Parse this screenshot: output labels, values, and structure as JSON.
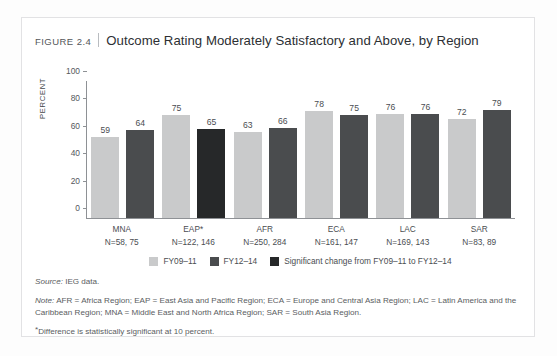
{
  "figure": {
    "number_label": "FIGURE 2.4",
    "heading": "Outcome Rating Moderately Satisfactory and Above, by Region"
  },
  "colors": {
    "series_fy0911": "#c9cacb",
    "series_fy1214": "#4a4c4e",
    "series_significant": "#262829",
    "axis": "#8e9195",
    "frame_border": "#e2e2e4",
    "text": "#4a4d51"
  },
  "notes": {
    "source_label": "Source:",
    "source_text": "IEG data.",
    "note_label": "Note:",
    "note_text": "AFR = Africa Region; EAP = East Asia and Pacific Region; ECA = Europe and Central Asia Region; LAC = Latin America and the Caribbean Region; MNA = Middle East and North Africa Region; SAR = South Asia Region.",
    "star_marker": "*",
    "star_text": "Difference is statistically significant at 10 percent."
  },
  "chart_data": {
    "type": "bar",
    "title": "Outcome Rating Moderately Satisfactory and Above, by Region",
    "xlabel": "",
    "ylabel": "PERCENT",
    "ylim": [
      0,
      100
    ],
    "yticks": [
      0,
      20,
      40,
      60,
      80,
      100
    ],
    "grid": false,
    "legend_position": "bottom-center",
    "categories": [
      "MNA",
      "EAP*",
      "AFR",
      "ECA",
      "LAC",
      "SAR"
    ],
    "category_sublabels": [
      "N=58, 75",
      "N=122, 146",
      "N=250, 284",
      "N=161, 147",
      "N=169, 143",
      "N=83, 89"
    ],
    "series": [
      {
        "name": "FY09–11",
        "values": [
          59,
          75,
          63,
          78,
          76,
          72
        ]
      },
      {
        "name": "FY12–14",
        "values": [
          64,
          65,
          66,
          75,
          76,
          79
        ]
      }
    ],
    "significant_change_flags": [
      false,
      true,
      false,
      false,
      false,
      false
    ],
    "legend": [
      {
        "label": "FY09–11",
        "color": "#c9cacb"
      },
      {
        "label": "FY12–14",
        "color": "#4a4c4e"
      },
      {
        "label": "Significant change from FY09–11 to FY12–14",
        "color": "#262829"
      }
    ],
    "annotations": [
      "*Difference is statistically significant at 10 percent."
    ]
  }
}
